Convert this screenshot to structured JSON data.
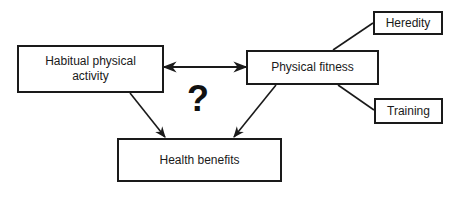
{
  "diagram": {
    "nodes": {
      "habitual_activity": {
        "label": "Habitual physical activity"
      },
      "physical_fitness": {
        "label": "Physical fitness"
      },
      "heredity": {
        "label": "Heredity"
      },
      "training": {
        "label": "Training"
      },
      "health_benefits": {
        "label": "Health benefits"
      }
    },
    "annotation": {
      "question_mark": "?"
    },
    "edges": [
      {
        "from": "habitual_activity",
        "to": "physical_fitness",
        "type": "bidirectional-arrow"
      },
      {
        "from": "habitual_activity",
        "to": "health_benefits",
        "type": "arrow"
      },
      {
        "from": "physical_fitness",
        "to": "health_benefits",
        "type": "arrow"
      },
      {
        "from": "heredity",
        "to": "physical_fitness",
        "type": "line"
      },
      {
        "from": "training",
        "to": "physical_fitness",
        "type": "line"
      }
    ],
    "colors": {
      "stroke": "#1a1a1a",
      "background": "#ffffff"
    }
  }
}
